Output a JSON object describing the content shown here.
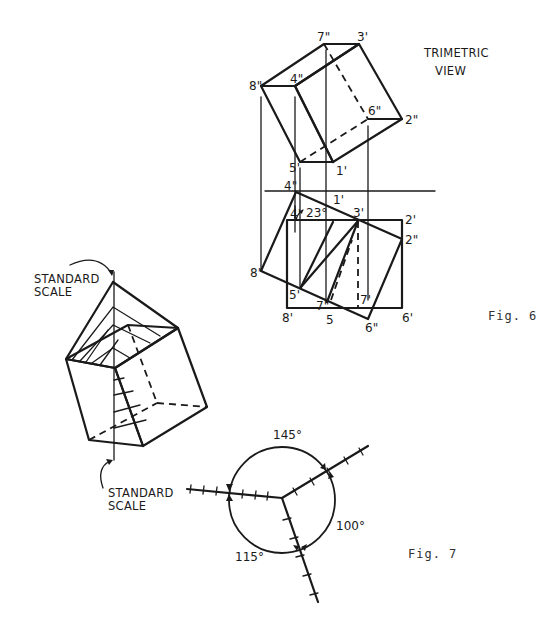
{
  "figures": {
    "fig6": {
      "caption": "Fig. 6",
      "title_line1": "TRIMETRIC",
      "title_line2": "VIEW",
      "upper_view_labels": {
        "p7": "7\"",
        "p3": "3'",
        "p8": "8\"",
        "p4": "4\"",
        "p6": "6\"",
        "p2": "2\"",
        "p5": "5'",
        "p1": "1'"
      },
      "lower_view_labels": {
        "p4dd": "4\"",
        "p4": "4'",
        "angle": "23°",
        "p1": "1'",
        "p3": "3'",
        "p2": "2'",
        "p2dd": "2\"",
        "p8dd": "8\"",
        "p5p": "5'",
        "p7dd": "7\"",
        "p7p": "7'",
        "p8p": "8'",
        "p5": "5",
        "p6dd": "6\"",
        "p6p": "6'"
      }
    },
    "iso": {
      "top_label_line1": "STANDARD",
      "top_label_line2": "SCALE",
      "bottom_label_line1": "STANDARD",
      "bottom_label_line2": "SCALE"
    },
    "fig7": {
      "caption": "Fig. 7",
      "angles": {
        "top": "145°",
        "right": "100°",
        "left": "115°"
      }
    }
  },
  "colors": {
    "ink": "#1a1a1a",
    "background": "#ffffff",
    "caption": "#333333"
  }
}
